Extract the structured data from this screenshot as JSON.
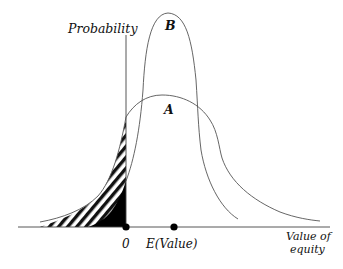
{
  "diagram": {
    "type": "probability-distribution-comparison",
    "y_axis_label": "Probability",
    "x_axis_label_line1": "Value of",
    "x_axis_label_line2": "equity",
    "curves": [
      {
        "id": "A",
        "label": "A",
        "description": "wide distribution with fat left tail crossing zero"
      },
      {
        "id": "B",
        "label": "B",
        "description": "narrow tall distribution centered near expected value"
      }
    ],
    "x_markers": [
      {
        "label": "0",
        "position": "origin"
      },
      {
        "label": "E(Value)",
        "position": "expected value"
      }
    ],
    "shaded_regions": [
      {
        "name": "curve-A-negative-tail",
        "style": "hatched"
      },
      {
        "name": "curve-B-negative-tail",
        "style": "solid black"
      }
    ],
    "colors": {
      "line": "#555555",
      "axis": "#333333",
      "fill": "#000000",
      "background": "#ffffff"
    }
  }
}
